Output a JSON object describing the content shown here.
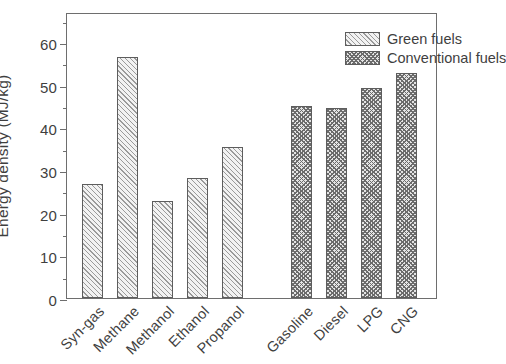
{
  "chart_data": {
    "type": "bar",
    "title": "",
    "xlabel": "",
    "ylabel": "Energy density (MJ/kg)",
    "ylim": [
      0,
      67
    ],
    "yticks": [
      0,
      10,
      20,
      30,
      40,
      50,
      60
    ],
    "ytick_labels": [
      "0",
      "10",
      "20",
      "30",
      "40",
      "50",
      "60"
    ],
    "minor_ytick_step": 5,
    "grid": false,
    "legend_position": "top-right",
    "categories": [
      "Syn-gas",
      "Methane",
      "Methanol",
      "Ethanol",
      "Propanol",
      "Gasoline",
      "Diesel",
      "LPG",
      "CNG"
    ],
    "values": [
      26.8,
      56.4,
      22.8,
      28.0,
      35.3,
      45.0,
      44.6,
      49.3,
      52.8
    ],
    "groups": [
      {
        "name": "Green fuels",
        "categories": [
          "Syn-gas",
          "Methane",
          "Methanol",
          "Ethanol",
          "Propanol"
        ],
        "values": [
          26.8,
          56.4,
          22.8,
          28.0,
          35.3
        ]
      },
      {
        "name": "Conventional fuels",
        "categories": [
          "Gasoline",
          "Diesel",
          "LPG",
          "CNG"
        ],
        "values": [
          45.0,
          44.6,
          49.3,
          52.8
        ]
      }
    ],
    "series": [
      {
        "name": "Green fuels",
        "values": [
          26.8,
          56.4,
          22.8,
          28.0,
          35.3,
          null,
          null,
          null,
          null
        ]
      },
      {
        "name": "Conventional fuels",
        "values": [
          null,
          null,
          null,
          null,
          null,
          45.0,
          44.6,
          49.3,
          52.8
        ]
      }
    ]
  },
  "axis": {
    "y_title": "Energy density (MJ/kg)",
    "y_tick_labels": [
      "60",
      "50",
      "40",
      "30",
      "20",
      "10",
      "0"
    ]
  },
  "legend": {
    "entries": [
      {
        "label": "Green fuels",
        "pattern": "diagonal-hatch"
      },
      {
        "label": "Conventional fuels",
        "pattern": "cross-hatch"
      }
    ]
  },
  "x_labels": [
    "Syn-gas",
    "Methane",
    "Methanol",
    "Ethanol",
    "Propanol",
    "Gasoline",
    "Diesel",
    "LPG",
    "CNG"
  ],
  "caption": {
    "text": ""
  }
}
